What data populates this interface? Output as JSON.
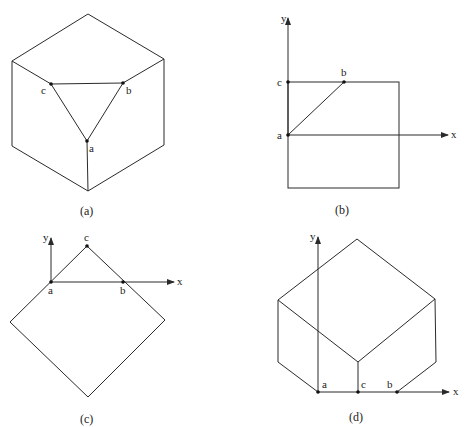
{
  "figure": {
    "panels": [
      {
        "id": "a",
        "caption": "(a)",
        "description": "Cube in isometric view with triangle abc cut across the top corner",
        "points": {
          "a": "a",
          "b": "b",
          "c": "c"
        }
      },
      {
        "id": "b",
        "caption": "(b)",
        "description": "Square face with x-y axes at point a; line from a to b, points c and b on top edge",
        "points": {
          "a": "a",
          "b": "b",
          "c": "c"
        },
        "axes": {
          "x": "x",
          "y": "y"
        }
      },
      {
        "id": "c",
        "caption": "(c)",
        "description": "Square rotated 45 degrees with x-y axes at a; points a and b on x-axis, c at top vertex",
        "points": {
          "a": "a",
          "b": "b",
          "c": "c"
        },
        "axes": {
          "x": "x",
          "y": "y"
        }
      },
      {
        "id": "d",
        "caption": "(d)",
        "description": "Cube in isometric view resting on x-axis with points a, c, b along the bottom",
        "points": {
          "a": "a",
          "b": "b",
          "c": "c"
        },
        "axes": {
          "x": "x",
          "y": "y"
        }
      }
    ]
  }
}
